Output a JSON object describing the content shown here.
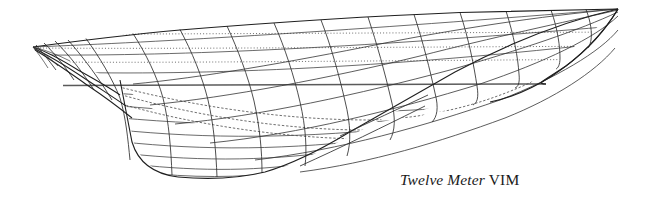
{
  "figure": {
    "kind": "naval-architecture-lines-plan",
    "orientation": "stern-at-left, bow-at-right, perspective body-and-profile view",
    "background_color": "#ffffff",
    "line_color": "#2b2b2b",
    "light_line_color": "#555555",
    "dotted_line_color": "#4a4a4a"
  },
  "caption": {
    "italic_part": "Twelve Meter",
    "roman_part": "VIM",
    "full_text": "Twelve Meter VIM",
    "x": 400,
    "y": 171,
    "font_size_px": 15.5
  },
  "geometry": {
    "stern_tip": [
      33,
      47
    ],
    "bow_tip": [
      618,
      9
    ],
    "keel_lowest": [
      218,
      177
    ],
    "load_waterline": {
      "y": 85,
      "x_start": 63,
      "x_end": 546
    },
    "sheer_line": [
      [
        33,
        47
      ],
      [
        90,
        38
      ],
      [
        160,
        31
      ],
      [
        240,
        25
      ],
      [
        330,
        19
      ],
      [
        430,
        14
      ],
      [
        520,
        11
      ],
      [
        618,
        9
      ]
    ],
    "canoe_body_bottom": [
      [
        33,
        47
      ],
      [
        70,
        62
      ],
      [
        110,
        78
      ],
      [
        170,
        92
      ],
      [
        250,
        105
      ],
      [
        340,
        118
      ],
      [
        430,
        112
      ],
      [
        520,
        92
      ],
      [
        580,
        62
      ],
      [
        618,
        9
      ]
    ],
    "keel_profile": [
      [
        120,
        80
      ],
      [
        128,
        110
      ],
      [
        133,
        140
      ],
      [
        145,
        165
      ],
      [
        175,
        176
      ],
      [
        218,
        178
      ],
      [
        260,
        174
      ],
      [
        300,
        160
      ],
      [
        345,
        137
      ],
      [
        400,
        110
      ]
    ]
  },
  "grid": {
    "waterlines_dotted_y": [
      32,
      47,
      62,
      75
    ],
    "waterlines_solid_y": [
      85,
      96,
      108,
      120,
      132,
      144,
      156,
      166
    ],
    "station_count": 13,
    "station_spacing_px": 47,
    "buttock_count": 6,
    "description": "dotted horizontal waterlines above the load line, solid waterlines through the keel, curved vertical station lines, and diagonal buttock lines"
  }
}
